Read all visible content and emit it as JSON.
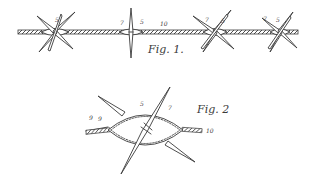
{
  "figures": [
    {
      "id": "fig1",
      "title": "Fig. 1.",
      "description": "Twisted two-strand wire with four star-shaped barbs",
      "barbs": [
        {
          "labels": [
            "5"
          ]
        },
        {
          "labels": [
            "7",
            "5"
          ]
        },
        {
          "labels": [
            "7",
            "5"
          ]
        },
        {
          "labels": [
            "7",
            "5"
          ]
        }
      ],
      "wire_label": "10"
    },
    {
      "id": "fig2",
      "title": "Fig. 2",
      "description": "Enlarged view of a single barb with eye-shaped loop around wire",
      "labels": {
        "barb": "5",
        "twist": "7",
        "strand_a": "9",
        "strand_b": "9",
        "wire": "10"
      }
    }
  ],
  "colors": {
    "ink": "#3a3a3a",
    "paper": "#ffffff"
  }
}
